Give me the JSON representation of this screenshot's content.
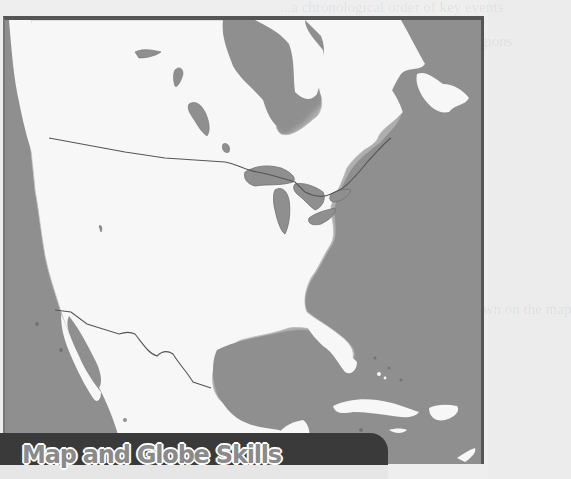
{
  "page": {
    "section_banner": "Map and Globe Skills",
    "colors": {
      "water": "#8f8f8f",
      "land": "#f7f7f7",
      "frame_border": "#555555",
      "banner_bg": "#3a3a3a",
      "banner_text": "#8a8a8a"
    }
  },
  "map": {
    "region": "North America",
    "features": [
      "Canada",
      "United States",
      "Mexico",
      "Great Lakes",
      "Hudson Bay",
      "Gulf of Mexico",
      "Caribbean islands",
      "Baja California",
      "Florida",
      "Cuba",
      "Hispaniola",
      "Jamaica",
      "Bahamas",
      "Yucatan Peninsula",
      "Newfoundland"
    ],
    "borders": [
      "Canada-US border",
      "US-Mexico border"
    ]
  },
  "bleed_through_text": [
    "...a chronological order of key events",
    "...ant dates for the world's regions",
    "...strips forming a time frame",
    "...each section of the line",
    "...the most significant",
    "...he margins",
    "...s through the keyboard",
    "Use the map to the right to answer the",
    "these following questions.",
    "1. What features do you think are shown on the map"
  ]
}
